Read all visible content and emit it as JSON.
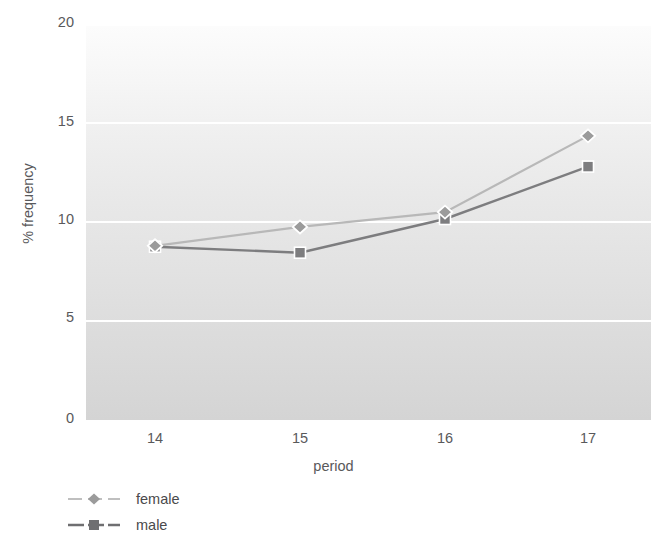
{
  "chart_data": {
    "type": "line",
    "title": "",
    "xlabel": "period",
    "ylabel": "% frequency",
    "categories": [
      14,
      15,
      16,
      17
    ],
    "x_tick_labels": [
      "14",
      "15",
      "16",
      "17"
    ],
    "y_tick_labels": [
      "0",
      "5",
      "10",
      "15",
      "20"
    ],
    "y_ticks": [
      0,
      5,
      10,
      15,
      20
    ],
    "ylim": [
      0,
      20
    ],
    "grid": "horizontal-white-gridlines",
    "legend_position": "below-left",
    "series": [
      {
        "name": "female",
        "values": [
          8.75,
          9.7,
          10.45,
          14.3
        ],
        "color": "#b8b8b8",
        "marker": "diamond"
      },
      {
        "name": "male",
        "values": [
          8.7,
          8.4,
          10.1,
          12.75
        ],
        "color": "#7d7d7f",
        "marker": "square"
      }
    ]
  },
  "axes": {
    "y_title": "% frequency",
    "x_title": "period",
    "y_ticks": [
      {
        "label": "20",
        "value": 20
      },
      {
        "label": "15",
        "value": 15
      },
      {
        "label": "10",
        "value": 10
      },
      {
        "label": "5",
        "value": 5
      },
      {
        "label": "0",
        "value": 0
      }
    ],
    "x_ticks": [
      {
        "label": "14",
        "value": 14
      },
      {
        "label": "15",
        "value": 15
      },
      {
        "label": "16",
        "value": 16
      },
      {
        "label": "17",
        "value": 17
      }
    ]
  },
  "legend": {
    "entries": [
      {
        "label": "female",
        "color": "#b8b8b8",
        "marker": "diamond-marker-icon"
      },
      {
        "label": "male",
        "color": "#7d7d7f",
        "marker": "square-marker-icon"
      }
    ]
  },
  "colors": {
    "female": "#b8b8b8",
    "male": "#7d7d7f",
    "gridline": "#ffffff",
    "panel_top": "#fcfcfc",
    "panel_bottom": "#d4d4d4",
    "text": "#59595b"
  }
}
